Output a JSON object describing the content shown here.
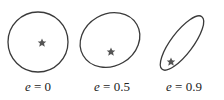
{
  "colors": {
    "orbit": "#3a3a3a",
    "star": "#555555",
    "text": "#222222"
  },
  "orbits": [
    {
      "e_label": "e",
      "value": "= 0",
      "eccentricity": 0
    },
    {
      "e_label": "e",
      "value": "= 0.5",
      "eccentricity": 0.5
    },
    {
      "e_label": "e",
      "value": "= 0.9",
      "eccentricity": 0.9
    }
  ]
}
